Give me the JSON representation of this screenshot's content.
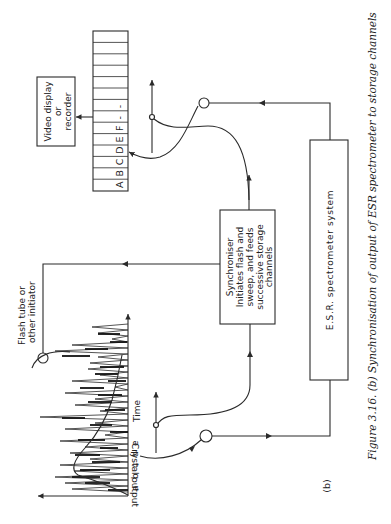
{
  "figure": {
    "panel_label": "(b)",
    "caption": "Figure 3.16. (b) Synchronisation of output of ESR spectrometer to storage channels",
    "orientation": "rotated 90° counter-clockwise"
  },
  "blocks": {
    "video_display": {
      "line1": "Video display",
      "line2": "or",
      "line3": "recorder"
    },
    "synchroniser": {
      "line1": "Synchroniser",
      "line2": "Initiates flash and",
      "line3": "sweep, and feeds",
      "line4": "successive storage",
      "line5": "channels"
    },
    "esr": {
      "label": "E.S.R. spectrometer system"
    },
    "flash_tube": {
      "line1": "Flash tube or",
      "line2": "other initiator"
    }
  },
  "storage_register": {
    "cell_count": 14,
    "labels": [
      "A",
      "B",
      "C",
      "D",
      "E",
      "F",
      "-",
      "-",
      "",
      "",
      "",
      "",
      "",
      ""
    ]
  },
  "plot": {
    "y_axis_label": "Crystal output",
    "x_axis_label": "Time",
    "markers": [
      "a",
      "b",
      "c",
      "d",
      "e"
    ]
  }
}
